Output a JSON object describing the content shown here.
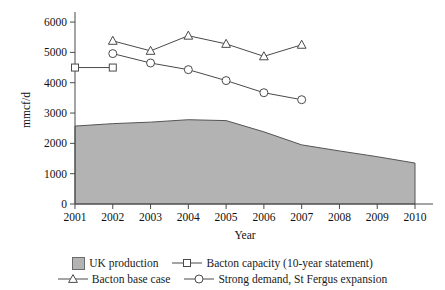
{
  "chart_data": {
    "type": "area",
    "title": "",
    "xlabel": "Year",
    "ylabel": "mmcf/d",
    "grid": false,
    "legend_position": "bottom",
    "x": [
      2001,
      2002,
      2003,
      2004,
      2005,
      2006,
      2007,
      2008,
      2009,
      2010
    ],
    "xtick_labels": [
      "2001",
      "2002",
      "2003",
      "2004",
      "2005",
      "2006",
      "2007",
      "2008",
      "2009",
      "2010"
    ],
    "ytick_labels": [
      "0",
      "1000",
      "2000",
      "3000",
      "4000",
      "5000",
      "6000"
    ],
    "ytick_values": [
      0,
      1000,
      2000,
      3000,
      4000,
      5000,
      6000
    ],
    "ylim": [
      0,
      6200
    ],
    "xlim": [
      2001,
      2010
    ],
    "series": [
      {
        "name": "UK production",
        "type": "area",
        "marker": "none",
        "color": "#b3b3b3",
        "x": [
          2001,
          2002,
          2003,
          2004,
          2005,
          2006,
          2007,
          2008,
          2009,
          2010
        ],
        "values": [
          2570,
          2650,
          2700,
          2780,
          2750,
          2380,
          1950,
          1750,
          1560,
          1350
        ]
      },
      {
        "name": "Bacton capacity (10-year statement)",
        "type": "line",
        "marker": "square",
        "color": "#4a4a4a",
        "x": [
          2001,
          2002
        ],
        "values": [
          4500,
          4500
        ]
      },
      {
        "name": "Bacton base case",
        "type": "line",
        "marker": "triangle",
        "color": "#4a4a4a",
        "x": [
          2002,
          2003,
          2004,
          2005,
          2006,
          2007
        ],
        "values": [
          5380,
          5050,
          5550,
          5280,
          4870,
          5250
        ]
      },
      {
        "name": "Strong demand, St Fergus expansion",
        "type": "line",
        "marker": "circle",
        "color": "#4a4a4a",
        "x": [
          2002,
          2003,
          2004,
          2005,
          2006,
          2007
        ],
        "values": [
          4960,
          4650,
          4430,
          4070,
          3670,
          3440
        ]
      }
    ]
  },
  "legend": {
    "rows": [
      [
        {
          "label": "UK production",
          "marker": "area-swatch"
        },
        {
          "label": "Bacton capacity (10-year statement)",
          "marker": "square"
        }
      ],
      [
        {
          "label": "Bacton base case",
          "marker": "triangle"
        },
        {
          "label": "Strong demand, St Fergus expansion",
          "marker": "circle"
        }
      ]
    ]
  }
}
